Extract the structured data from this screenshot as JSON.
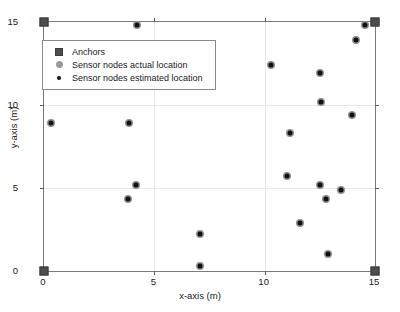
{
  "chart_data": {
    "type": "scatter",
    "title": "",
    "xlabel": "x-axis (m)",
    "ylabel": "y-axis (m)",
    "xlim": [
      0,
      15
    ],
    "ylim": [
      0,
      15
    ],
    "xticks": [
      0,
      5,
      10,
      15
    ],
    "yticks": [
      0,
      5,
      10,
      15
    ],
    "grid": true,
    "legend_position": "upper-left-inside",
    "series": [
      {
        "name": "Anchors",
        "marker": "square",
        "color": "#4d4d4d",
        "points": [
          {
            "x": 0,
            "y": 0
          },
          {
            "x": 0,
            "y": 15
          },
          {
            "x": 15,
            "y": 0
          },
          {
            "x": 15,
            "y": 15
          }
        ]
      },
      {
        "name": "Sensor nodes actual location",
        "marker": "circle",
        "color": "#8f8f8f",
        "points": [
          {
            "x": 0.3,
            "y": 8.9
          },
          {
            "x": 3.85,
            "y": 8.9
          },
          {
            "x": 4.2,
            "y": 14.8
          },
          {
            "x": 4.15,
            "y": 5.2
          },
          {
            "x": 3.8,
            "y": 4.35
          },
          {
            "x": 7.05,
            "y": 2.2
          },
          {
            "x": 7.05,
            "y": 0.3
          },
          {
            "x": 10.3,
            "y": 12.4
          },
          {
            "x": 11.0,
            "y": 5.7
          },
          {
            "x": 11.15,
            "y": 8.3
          },
          {
            "x": 11.6,
            "y": 2.9
          },
          {
            "x": 12.5,
            "y": 11.9
          },
          {
            "x": 12.55,
            "y": 10.2
          },
          {
            "x": 12.5,
            "y": 5.2
          },
          {
            "x": 12.8,
            "y": 4.35
          },
          {
            "x": 12.85,
            "y": 1.0
          },
          {
            "x": 13.45,
            "y": 4.9
          },
          {
            "x": 13.95,
            "y": 9.4
          },
          {
            "x": 14.15,
            "y": 13.9
          },
          {
            "x": 14.55,
            "y": 14.8
          }
        ]
      },
      {
        "name": "Sensor nodes estimated location",
        "marker": "dot",
        "color": "#111111",
        "points": [
          {
            "x": 0.3,
            "y": 8.9
          },
          {
            "x": 3.85,
            "y": 8.9
          },
          {
            "x": 4.2,
            "y": 14.8
          },
          {
            "x": 4.15,
            "y": 5.2
          },
          {
            "x": 3.8,
            "y": 4.35
          },
          {
            "x": 7.05,
            "y": 2.2
          },
          {
            "x": 7.05,
            "y": 0.3
          },
          {
            "x": 10.3,
            "y": 12.4
          },
          {
            "x": 11.0,
            "y": 5.7
          },
          {
            "x": 11.15,
            "y": 8.3
          },
          {
            "x": 11.6,
            "y": 2.9
          },
          {
            "x": 12.5,
            "y": 11.9
          },
          {
            "x": 12.55,
            "y": 10.2
          },
          {
            "x": 12.5,
            "y": 5.2
          },
          {
            "x": 12.8,
            "y": 4.35
          },
          {
            "x": 12.85,
            "y": 1.0
          },
          {
            "x": 13.45,
            "y": 4.9
          },
          {
            "x": 13.95,
            "y": 9.4
          },
          {
            "x": 14.15,
            "y": 13.9
          },
          {
            "x": 14.55,
            "y": 14.8
          }
        ]
      }
    ]
  },
  "axes": {
    "x_title": "x-axis (m)",
    "y_title": "y-axis (m)",
    "x_tick_labels": [
      "0",
      "5",
      "10",
      "15"
    ],
    "y_tick_labels": [
      "0",
      "5",
      "10",
      "15"
    ]
  },
  "legend": {
    "items": [
      {
        "label": "Anchors",
        "key": "anchor-square-marker"
      },
      {
        "label": "Sensor nodes actual location",
        "key": "actual-circle-marker"
      },
      {
        "label": "Sensor nodes estimated location",
        "key": "estimated-dot-marker"
      }
    ]
  },
  "colors": {
    "anchor": "#4d4d4d",
    "actual": "#8f8f8f",
    "estimated": "#111111",
    "grid": "#e8e8e8",
    "frame": "#7a7a7a"
  }
}
